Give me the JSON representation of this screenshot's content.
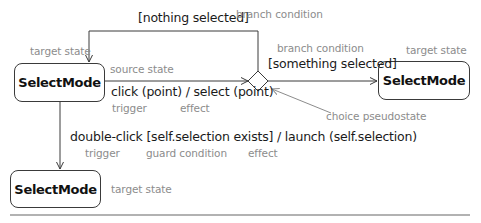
{
  "diagram": {
    "type": "UML state machine transition notation",
    "states": {
      "source": "SelectMode",
      "target_right": "SelectMode",
      "target_bottom": "SelectMode"
    },
    "transitions": {
      "top_guard": "[nothing selected]",
      "right_guard": "[something selected]",
      "click": "click (point) / select (point)",
      "double_click": "double-click [self.selection exists] / launch (self.selection)"
    },
    "annotations": {
      "branch_condition_top": "branch condition",
      "branch_condition_right": "branch condition",
      "target_state_top_left": "target state",
      "target_state_right": "target state",
      "target_state_bottom": "target state",
      "source_state": "source state",
      "trigger_1": "trigger",
      "effect_1": "effect",
      "choice_pseudostate": "choice pseudostate",
      "trigger_2": "trigger",
      "guard_condition": "guard condition",
      "effect_2": "effect"
    },
    "colors": {
      "line": "#3a3a3a",
      "annotation_text": "#8c8c8c",
      "label_text": "#1a1a1a"
    }
  }
}
